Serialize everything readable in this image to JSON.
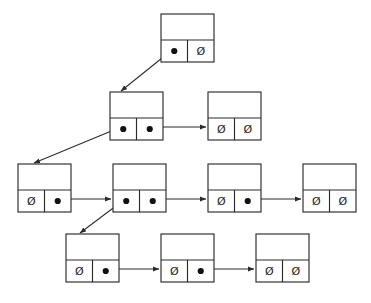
{
  "diagram": {
    "kind": "pointer-structure-diagram",
    "null_symbol": "Ø",
    "colors": {
      "background": "#ffffff",
      "stroke": "#2b2b2b",
      "dot": "#111111",
      "text": "#1a1a1a"
    },
    "geometry": {
      "node_width": 53,
      "node_height": 48,
      "top_row_height": 26,
      "bottom_row_height": 22
    },
    "nodes": [
      {
        "id": "n-top",
        "label": "top-node",
        "x": 161,
        "y": 14,
        "left_cell": {
          "type": "pointer",
          "text": ""
        },
        "right_cell": {
          "type": "null",
          "text": "Ø"
        }
      },
      {
        "id": "n-r2-a",
        "label": "row2-node-1",
        "x": 110,
        "y": 92,
        "left_cell": {
          "type": "pointer",
          "text": ""
        },
        "right_cell": {
          "type": "pointer",
          "text": ""
        }
      },
      {
        "id": "n-r2-b",
        "label": "row2-node-2",
        "x": 208,
        "y": 92,
        "left_cell": {
          "type": "null",
          "text": "Ø"
        },
        "right_cell": {
          "type": "null",
          "text": "Ø"
        }
      },
      {
        "id": "n-r3-a",
        "label": "row3-node-1",
        "x": 18,
        "y": 164,
        "left_cell": {
          "type": "null",
          "text": "Ø"
        },
        "right_cell": {
          "type": "pointer",
          "text": ""
        }
      },
      {
        "id": "n-r3-b",
        "label": "row3-node-2",
        "x": 113,
        "y": 164,
        "left_cell": {
          "type": "pointer",
          "text": ""
        },
        "right_cell": {
          "type": "pointer",
          "text": ""
        }
      },
      {
        "id": "n-r3-c",
        "label": "row3-node-3",
        "x": 208,
        "y": 164,
        "left_cell": {
          "type": "null",
          "text": "Ø"
        },
        "right_cell": {
          "type": "pointer",
          "text": ""
        }
      },
      {
        "id": "n-r3-d",
        "label": "row3-node-4",
        "x": 303,
        "y": 164,
        "left_cell": {
          "type": "null",
          "text": "Ø"
        },
        "right_cell": {
          "type": "null",
          "text": "Ø"
        }
      },
      {
        "id": "n-r4-a",
        "label": "row4-node-1",
        "x": 66,
        "y": 234,
        "left_cell": {
          "type": "null",
          "text": "Ø"
        },
        "right_cell": {
          "type": "pointer",
          "text": ""
        }
      },
      {
        "id": "n-r4-b",
        "label": "row4-node-2",
        "x": 161,
        "y": 234,
        "left_cell": {
          "type": "null",
          "text": "Ø"
        },
        "right_cell": {
          "type": "pointer",
          "text": ""
        }
      },
      {
        "id": "n-r4-c",
        "label": "row4-node-3",
        "x": 256,
        "y": 234,
        "left_cell": {
          "type": "null",
          "text": "Ø"
        },
        "right_cell": {
          "type": "null",
          "text": "Ø"
        }
      }
    ],
    "edges": [
      {
        "id": "e-top-down",
        "from": "n-top.left",
        "to": "n-r2-a.top",
        "style": "diagonal-down-left",
        "x1": 174.5,
        "y1": 48,
        "x2": 121,
        "y2": 91
      },
      {
        "id": "e-r2-right",
        "from": "n-r2-a.right",
        "to": "n-r2-b.left",
        "style": "horizontal",
        "x1": 150,
        "y1": 127,
        "x2": 206,
        "y2": 127
      },
      {
        "id": "e-r2-down",
        "from": "n-r2-a.left",
        "to": "n-r3-a.top",
        "style": "diagonal-down-left",
        "x1": 123.5,
        "y1": 126,
        "x2": 34,
        "y2": 163
      },
      {
        "id": "e-r3-a-right",
        "from": "n-r3-a.right",
        "to": "n-r3-b.left",
        "style": "horizontal",
        "x1": 58,
        "y1": 199,
        "x2": 111,
        "y2": 199
      },
      {
        "id": "e-r3-b-down",
        "from": "n-r3-b.left",
        "to": "n-r4-a.top",
        "style": "diagonal-down-left",
        "x1": 126.5,
        "y1": 198,
        "x2": 80,
        "y2": 233
      },
      {
        "id": "e-r3-b-right",
        "from": "n-r3-b.right",
        "to": "n-r3-c.left",
        "style": "horizontal",
        "x1": 153,
        "y1": 199,
        "x2": 206,
        "y2": 199
      },
      {
        "id": "e-r3-c-right",
        "from": "n-r3-c.right",
        "to": "n-r3-d.left",
        "style": "horizontal",
        "x1": 248,
        "y1": 199,
        "x2": 301,
        "y2": 199
      },
      {
        "id": "e-r4-a-right",
        "from": "n-r4-a.right",
        "to": "n-r4-b.left",
        "style": "horizontal",
        "x1": 106,
        "y1": 269,
        "x2": 159,
        "y2": 269
      },
      {
        "id": "e-r4-b-right",
        "from": "n-r4-b.right",
        "to": "n-r4-c.left",
        "style": "horizontal",
        "x1": 201,
        "y1": 269,
        "x2": 254,
        "y2": 269
      }
    ]
  }
}
